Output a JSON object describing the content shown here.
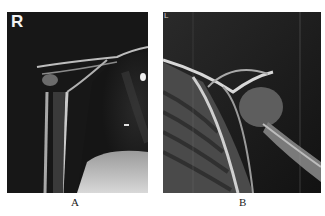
{
  "figure": {
    "panels": [
      {
        "id": "A",
        "caption": "A",
        "side_marker": "R",
        "description": "Right shoulder radiograph"
      },
      {
        "id": "B",
        "caption": "B",
        "side_marker": "L",
        "description": "Left shoulder radiograph"
      }
    ]
  },
  "colors": {
    "background": "#ffffff",
    "film_dark": "#1a1a1a",
    "bone": "#d8d8d8"
  }
}
